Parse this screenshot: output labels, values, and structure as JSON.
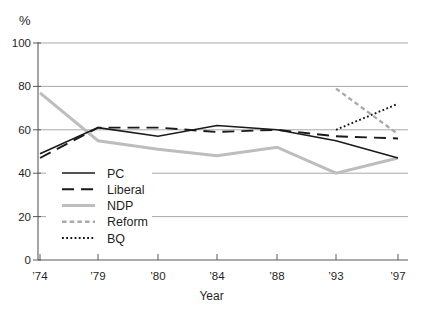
{
  "chart_data": {
    "type": "line",
    "title": "",
    "ylabel": "%",
    "xlabel": "Year",
    "x_tick_labels": [
      "’74",
      "’79",
      "’80",
      "’84",
      "’88",
      "’93",
      "’97"
    ],
    "y_ticks": [
      0,
      20,
      40,
      60,
      80,
      100
    ],
    "ylim": [
      0,
      100
    ],
    "grid": "horizontal",
    "legend_position": "inside-lower-left",
    "colors": {
      "black_line": "#1a1a1a",
      "gray_line": "#bdbdbd",
      "gray_dash": "#a9a9a9",
      "gridline": "#9f9f9f",
      "axis": "#5a5a5a",
      "text": "#1f1f1f"
    },
    "series": [
      {
        "name": "PC",
        "dash": "solid",
        "color": "#1a1a1a",
        "width": 1.6,
        "values": [
          49,
          61,
          57,
          62,
          60,
          55,
          47
        ]
      },
      {
        "name": "Liberal",
        "dash": "long-dash",
        "color": "#1a1a1a",
        "width": 1.9,
        "values": [
          47,
          61,
          61,
          59,
          60,
          57,
          56
        ]
      },
      {
        "name": "NDP",
        "dash": "solid",
        "color": "#bdbdbd",
        "width": 3.0,
        "values": [
          77,
          55,
          51,
          48,
          52,
          40,
          47
        ]
      },
      {
        "name": "Reform",
        "dash": "dash",
        "color": "#a9a9a9",
        "width": 2.3,
        "values": [
          null,
          null,
          null,
          null,
          null,
          79,
          58
        ]
      },
      {
        "name": "BQ",
        "dash": "dot",
        "color": "#141414",
        "width": 1.9,
        "values": [
          null,
          null,
          null,
          null,
          null,
          60,
          72
        ]
      }
    ]
  }
}
